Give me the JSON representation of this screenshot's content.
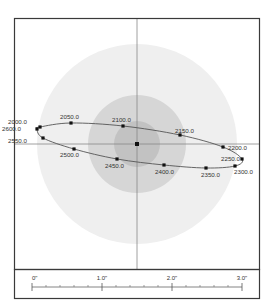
{
  "colors": {
    "background": "#ffffff",
    "frame": "#3a3a3a",
    "outer_zone": "#efefef",
    "middle_zone": "#d6d6d6",
    "inner_zone": "#c2c2c2",
    "crosshair": "#888888",
    "orbit": "#555555",
    "point": "#111111",
    "label": "#333333"
  },
  "plot": {
    "center": [
      137,
      144
    ],
    "zones": [
      {
        "name": "outer",
        "radius": 100
      },
      {
        "name": "middle",
        "radius": 49
      },
      {
        "name": "inner",
        "radius": 23
      }
    ],
    "orbit_points": [
      {
        "label": "2000.0",
        "x": 40,
        "y": 127,
        "lx": 8,
        "ly": 124,
        "anchor": "start"
      },
      {
        "label": "2050.0",
        "x": 71,
        "y": 123,
        "lx": 60,
        "ly": 119,
        "anchor": "start"
      },
      {
        "label": "2100.0",
        "x": 123,
        "y": 126,
        "lx": 112,
        "ly": 122,
        "anchor": "start"
      },
      {
        "label": "2150.0",
        "x": 180,
        "y": 135,
        "lx": 175,
        "ly": 133,
        "anchor": "start"
      },
      {
        "label": "2200.0",
        "x": 223,
        "y": 147,
        "lx": 228,
        "ly": 150,
        "anchor": "start"
      },
      {
        "label": "2250.0",
        "x": 242,
        "y": 159,
        "lx": 221,
        "ly": 161,
        "anchor": "start"
      },
      {
        "label": "2300.0",
        "x": 235,
        "y": 166,
        "lx": 234,
        "ly": 174,
        "anchor": "start"
      },
      {
        "label": "2350.0",
        "x": 206,
        "y": 168,
        "lx": 201,
        "ly": 177,
        "anchor": "start"
      },
      {
        "label": "2400.0",
        "x": 164,
        "y": 165,
        "lx": 155,
        "ly": 174,
        "anchor": "start"
      },
      {
        "label": "2450.0",
        "x": 117,
        "y": 159,
        "lx": 105,
        "ly": 168,
        "anchor": "start"
      },
      {
        "label": "2500.0",
        "x": 74,
        "y": 149,
        "lx": 60,
        "ly": 157,
        "anchor": "start"
      },
      {
        "label": "2550.0",
        "x": 43,
        "y": 138,
        "lx": 8,
        "ly": 143,
        "anchor": "start"
      },
      {
        "label": "2600.0",
        "x": 37,
        "y": 129,
        "lx": 2,
        "ly": 131,
        "anchor": "start"
      }
    ]
  },
  "scale": {
    "labels": [
      "0\"",
      "1.0\"",
      "2.0\"",
      "3.0\""
    ],
    "major_x": [
      32,
      102,
      172,
      242
    ],
    "minor_step": 14
  },
  "chart_data": {
    "type": "scatter",
    "title": "",
    "xlabel": "",
    "ylabel": "",
    "center_point": [
      0,
      0
    ],
    "series": [
      {
        "name": "orbit epochs",
        "labels": [
          "2000.0",
          "2050.0",
          "2100.0",
          "2150.0",
          "2200.0",
          "2250.0",
          "2300.0",
          "2350.0",
          "2400.0",
          "2450.0",
          "2500.0",
          "2550.0",
          "2600.0"
        ],
        "x_arcsec": [
          -1.39,
          -0.94,
          -0.2,
          0.61,
          1.23,
          1.5,
          1.4,
          0.99,
          0.39,
          -0.29,
          -0.9,
          -1.34,
          -1.43
        ],
        "y_arcsec": [
          0.24,
          0.3,
          0.26,
          0.13,
          -0.04,
          -0.21,
          -0.31,
          -0.34,
          -0.3,
          -0.21,
          -0.07,
          0.09,
          0.21
        ]
      }
    ],
    "zones_radius_arcsec": [
      1.43,
      0.7,
      0.33
    ],
    "scale_bar": {
      "ticks": [
        "0\"",
        "1.0\"",
        "2.0\"",
        "3.0\""
      ],
      "minor_per_major": 5
    },
    "grid": false,
    "legend": null
  }
}
